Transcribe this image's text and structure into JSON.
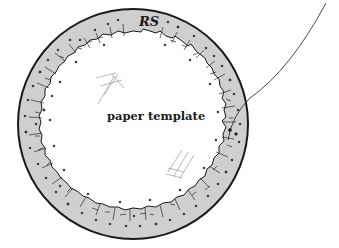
{
  "diagram": {
    "labels": {
      "ring_label": "RS",
      "center_label": "paper template"
    },
    "colors": {
      "ring_fill": "#cfcfcf",
      "stroke": "#1a1a1a",
      "background": "#ffffff",
      "fiber": "#8a8a8a"
    },
    "elements": [
      {
        "name": "outer-ring",
        "shape": "annulus",
        "center": [
          133,
          124
        ],
        "outer_radius": 115,
        "inner_radius": 93
      },
      {
        "name": "lead-wire",
        "shape": "curve",
        "from": [
          326,
          3
        ],
        "to": [
          226,
          142
        ]
      },
      {
        "name": "fiber-mark-upper",
        "position": [
          110,
          82
        ]
      },
      {
        "name": "fiber-mark-lower",
        "position": [
          178,
          160
        ]
      }
    ]
  }
}
